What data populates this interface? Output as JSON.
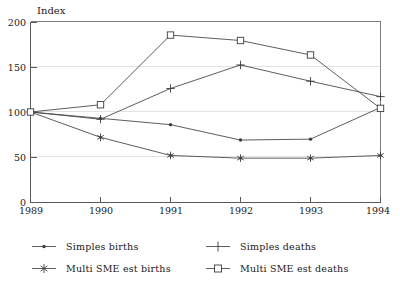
{
  "chart_data": {
    "type": "line",
    "title": "",
    "subtitle": "",
    "xlabel": "",
    "ylabel": "Index",
    "categories": [
      "1989",
      "1990",
      "1991",
      "1992",
      "1993",
      "1994"
    ],
    "x": [
      1989,
      1990,
      1991,
      1992,
      1993,
      1994
    ],
    "xlim": [
      1989,
      1994
    ],
    "ylim": [
      0,
      200
    ],
    "yticks": [
      0,
      50,
      100,
      150,
      200
    ],
    "ytick_labels": [
      "0",
      "50",
      "100",
      "150",
      "200"
    ],
    "xtick_labels": [
      "1989",
      "1990",
      "1991",
      "1992",
      "1993",
      "1994"
    ],
    "grid": true,
    "legend_position": "below",
    "series": [
      {
        "name": "Simples births",
        "marker": "dot",
        "values": [
          100,
          93,
          86,
          69,
          70,
          105
        ]
      },
      {
        "name": "Simples deaths",
        "marker": "plus",
        "values": [
          100,
          92,
          126,
          152,
          134,
          117
        ]
      },
      {
        "name": "Multi SME est births",
        "marker": "asterisk",
        "values": [
          100,
          72,
          52,
          49,
          49,
          52
        ]
      },
      {
        "name": "Multi SME est deaths",
        "marker": "square",
        "values": [
          100,
          108,
          185,
          179,
          163,
          104
        ]
      }
    ]
  },
  "axis": {
    "y_title": "Index",
    "y_tick_0": "0",
    "y_tick_1": "50",
    "y_tick_2": "100",
    "y_tick_3": "150",
    "y_tick_4": "200",
    "x_tick_0": "1989",
    "x_tick_1": "1990",
    "x_tick_2": "1991",
    "x_tick_3": "1992",
    "x_tick_4": "1993",
    "x_tick_5": "1994"
  },
  "legend": {
    "entries": [
      {
        "label": "Simples births",
        "marker": "dot"
      },
      {
        "label": "Simples deaths",
        "marker": "plus"
      },
      {
        "label": "Multi SME est births",
        "marker": "asterisk"
      },
      {
        "label": "Multi SME est deaths",
        "marker": "square"
      }
    ]
  },
  "colors": {
    "line": "#4b4b4b",
    "marker": "#3c3c3c",
    "axis": "#5a5a5a",
    "grid": "#e2e2e2",
    "text": "#1a1a1a",
    "background": "#ffffff"
  }
}
